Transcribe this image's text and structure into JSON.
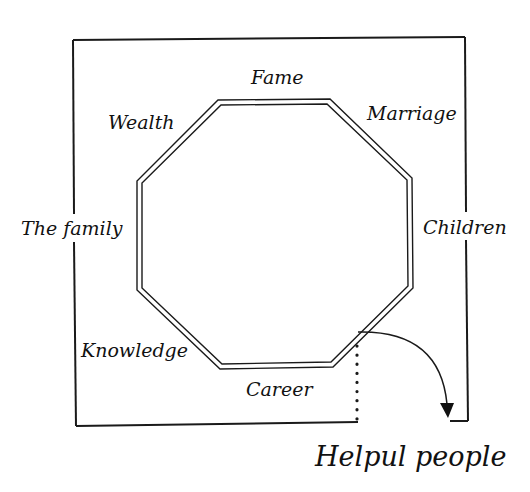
{
  "diagram": {
    "type": "bagua-map",
    "colors": {
      "line": "#1a1a1a",
      "text": "#111111",
      "background": "#ffffff"
    },
    "labels": {
      "fame": "Fame",
      "wealth": "Wealth",
      "marriage": "Marriage",
      "the_family": "The family",
      "children": "Children",
      "knowledge": "Knowledge",
      "career": "Career",
      "helpful_people": "Helpul people"
    },
    "shapes": {
      "outer_frame": "open rectangle border with gaps at left and right labels",
      "center": "double-line octagon",
      "connector": "dotted vertical line from octagon to frame bottom",
      "arrow": "curved arrow pointing down toward Helpful people corner"
    }
  }
}
